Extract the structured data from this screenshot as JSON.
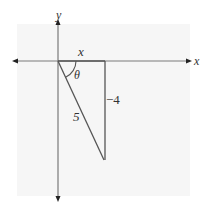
{
  "diagram": {
    "type": "reference-triangle",
    "colors": {
      "axis": "#7a7a7a",
      "triangle": "#555555",
      "text": "#333333",
      "panel": "#f6f6f6"
    },
    "axes": {
      "x_label": "x",
      "y_label": "y"
    },
    "triangle": {
      "adjacent_label": "x",
      "opposite_label": "−4",
      "hypotenuse_label": "5",
      "angle_label": "θ"
    }
  }
}
